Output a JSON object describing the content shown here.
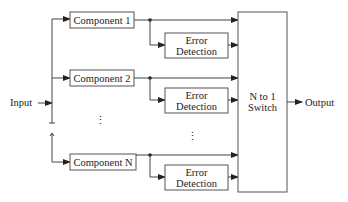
{
  "diagram": {
    "type": "block-diagram",
    "input": {
      "label": "Input"
    },
    "output": {
      "label": "Output"
    },
    "components": [
      {
        "label": "Component 1"
      },
      {
        "label": "Component 2"
      },
      {
        "label": "Component N"
      }
    ],
    "error_detectors": [
      {
        "line1": "Error",
        "line2": "Detection"
      },
      {
        "line1": "Error",
        "line2": "Detection"
      },
      {
        "line1": "Error",
        "line2": "Detection"
      }
    ],
    "switch": {
      "line1": "N to 1",
      "line2": "Switch"
    },
    "ellipsis": "⋮"
  }
}
